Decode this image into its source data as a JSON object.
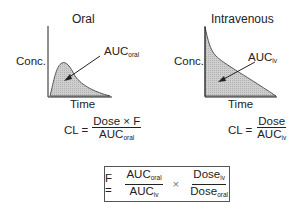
{
  "diagram": {
    "panels": [
      {
        "title": "Oral",
        "ylabel": "Conc.",
        "xlabel": "Time",
        "auc_label": "AUC",
        "auc_sub": "oral",
        "equation": {
          "lhs": "CL =",
          "num": "Dose × F",
          "den": "AUC",
          "den_sub": "oral"
        }
      },
      {
        "title": "Intravenous",
        "ylabel": "Conc.",
        "xlabel": "Time",
        "auc_label": "AUC",
        "auc_sub": "iv",
        "equation": {
          "lhs": "CL =",
          "num": "Dose",
          "den": "AUC",
          "den_sub": "iv"
        }
      }
    ],
    "boxed_equation": {
      "lhs": "F =",
      "frac1": {
        "num": "AUC",
        "num_sub": "oral",
        "den": "AUC",
        "den_sub": "iv"
      },
      "times": "×",
      "frac2": {
        "num": "Dose",
        "num_sub": "iv",
        "den": "Dose",
        "den_sub": "oral"
      }
    },
    "colors": {
      "fill": "#c8c8c8",
      "line": "#222222",
      "box_border": "#555555"
    }
  }
}
